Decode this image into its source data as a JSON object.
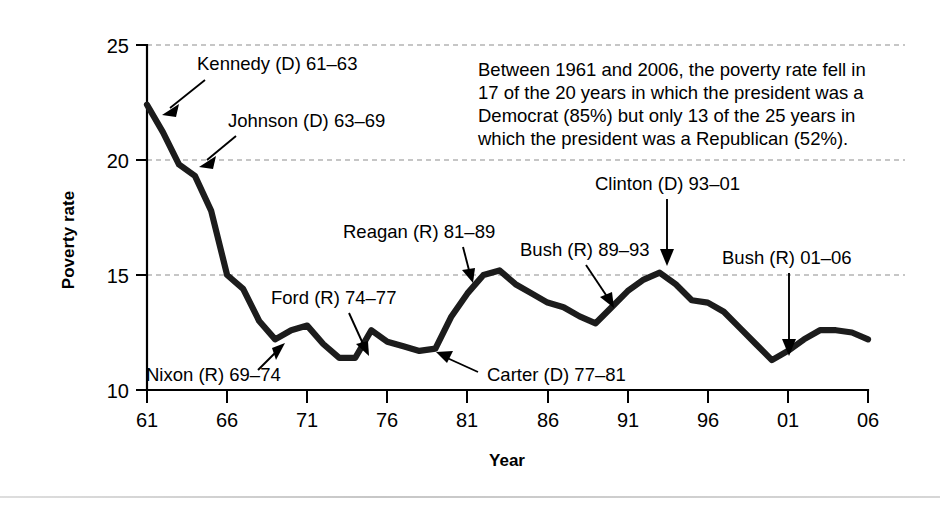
{
  "chart_data": {
    "type": "line",
    "title": "",
    "xlabel": "Year",
    "ylabel": "Poverty rate",
    "xlim": [
      1961,
      2006
    ],
    "ylim": [
      10,
      25
    ],
    "yticks": [
      10,
      15,
      20,
      25
    ],
    "ytick_labels": [
      "10",
      "15",
      "20",
      "25"
    ],
    "xticks": [
      1961,
      1966,
      1971,
      1976,
      1981,
      1986,
      1991,
      1996,
      2001,
      2006
    ],
    "xtick_labels": [
      "61",
      "66",
      "71",
      "76",
      "81",
      "86",
      "91",
      "96",
      "01",
      "06"
    ],
    "grid": "horizontal-dashed",
    "legend": "none",
    "series": [
      {
        "name": "Poverty rate",
        "color": "#1c1c1c",
        "x": [
          1961,
          1962,
          1963,
          1964,
          1965,
          1966,
          1967,
          1968,
          1969,
          1970,
          1971,
          1972,
          1973,
          1974,
          1975,
          1976,
          1977,
          1978,
          1979,
          1980,
          1981,
          1982,
          1983,
          1984,
          1985,
          1986,
          1987,
          1988,
          1989,
          1990,
          1991,
          1992,
          1993,
          1994,
          1995,
          1996,
          1997,
          1998,
          1999,
          2000,
          2001,
          2002,
          2003,
          2004,
          2005,
          2006
        ],
        "values": [
          22.4,
          21.2,
          19.8,
          19.3,
          17.8,
          15.0,
          14.4,
          13.0,
          12.2,
          12.6,
          12.8,
          12.0,
          11.4,
          11.4,
          12.6,
          12.1,
          11.9,
          11.7,
          11.8,
          13.2,
          14.2,
          15.0,
          15.2,
          14.6,
          14.2,
          13.8,
          13.6,
          13.2,
          12.9,
          13.6,
          14.3,
          14.8,
          15.1,
          14.6,
          13.9,
          13.8,
          13.4,
          12.7,
          12.0,
          11.3,
          11.7,
          12.2,
          12.6,
          12.6,
          12.5,
          12.2
        ]
      }
    ],
    "annotations": [
      {
        "id": "kennedy",
        "label": "Kennedy (D) 61–63",
        "target_year": 1962,
        "target_value": 22.0
      },
      {
        "id": "johnson",
        "label": "Johnson (D) 63–69",
        "target_year": 1964,
        "target_value": 19.6
      },
      {
        "id": "nixon",
        "label": "Nixon (R) 69–74",
        "target_year": 1969,
        "target_value": 12.2
      },
      {
        "id": "ford",
        "label": "Ford (R) 74–77",
        "target_year": 1974,
        "target_value": 11.5
      },
      {
        "id": "carter",
        "label": "Carter (D) 77–81",
        "target_year": 1979,
        "target_value": 11.8
      },
      {
        "id": "reagan",
        "label": "Reagan (R) 81–89",
        "target_year": 1982,
        "target_value": 14.9
      },
      {
        "id": "bush1",
        "label": "Bush (R) 89–93",
        "target_year": 1990,
        "target_value": 13.4
      },
      {
        "id": "clinton",
        "label": "Clinton (D) 93–01",
        "target_year": 1993,
        "target_value": 15.1
      },
      {
        "id": "bush2",
        "label": "Bush (R) 01–06",
        "target_year": 2000,
        "target_value": 11.4
      }
    ],
    "note": "Between 1961 and 2006, the poverty rate fell in 17 of the 20 years in which the president was a Democrat (85%) but only 13 of the 25 years in which the president was a Republican (52%)."
  },
  "labels": {
    "y_axis_title": "Poverty rate",
    "x_axis_title": "Year",
    "note_lines": [
      "Between 1961 and 2006, the poverty rate fell in",
      "17 of the 20 years in which the president was a",
      "Democrat (85%) but only 13 of the 25 years in",
      "which the president was a Republican (52%)."
    ]
  },
  "annotation_text": {
    "kennedy": "Kennedy (D) 61–63",
    "johnson": "Johnson (D) 63–69",
    "nixon": "Nixon (R) 69–74",
    "ford": "Ford (R) 74–77",
    "carter": "Carter (D) 77–81",
    "reagan": "Reagan (R) 81–89",
    "bush1": "Bush (R) 89–93",
    "clinton": "Clinton (D) 93–01",
    "bush2": "Bush (R) 01–06"
  },
  "ticks": {
    "y": [
      "10",
      "15",
      "20",
      "25"
    ],
    "x": [
      "61",
      "66",
      "71",
      "76",
      "81",
      "86",
      "91",
      "96",
      "01",
      "06"
    ]
  },
  "colors": {
    "line": "#1c1c1c",
    "axis": "#000000",
    "grid": "#8e8e8e",
    "background": "#ffffff"
  }
}
